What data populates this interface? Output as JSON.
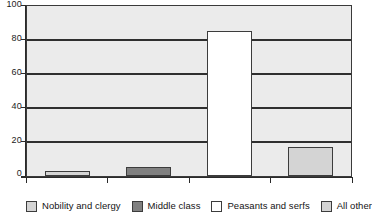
{
  "chart_data": {
    "type": "bar",
    "title": "",
    "subtitle": "",
    "xlabel": "",
    "ylabel": "",
    "ylim": [
      0,
      100
    ],
    "y_ticks": [
      "0",
      "20",
      "40",
      "60",
      "80",
      "100"
    ],
    "grid": true,
    "grid_axis": "y",
    "legend_position": "bottom",
    "x_tick_labels": [],
    "categories": [
      "Nobility and clergy",
      "Middle class",
      "Peasants and serfs",
      "All other"
    ],
    "values": [
      3,
      5,
      85,
      17
    ],
    "series": [
      {
        "name": "",
        "values": [
          3,
          5,
          85,
          17
        ]
      }
    ],
    "bar_colors": [
      "#d4d4d4",
      "#808080",
      "#ffffff",
      "#d4d4d4"
    ],
    "bar_border_color": "#3c3c3c",
    "plot_background": "#ebebeb",
    "gridline_color": "#2f2f2f",
    "axis_color": "#2a2a2a"
  },
  "legend": {
    "items": [
      {
        "label": "Nobility and clergy",
        "color": "#d4d4d4"
      },
      {
        "label": "Middle class",
        "color": "#808080"
      },
      {
        "label": "Peasants and serfs",
        "color": "#ffffff"
      },
      {
        "label": "All other",
        "color": "#d4d4d4"
      }
    ]
  }
}
